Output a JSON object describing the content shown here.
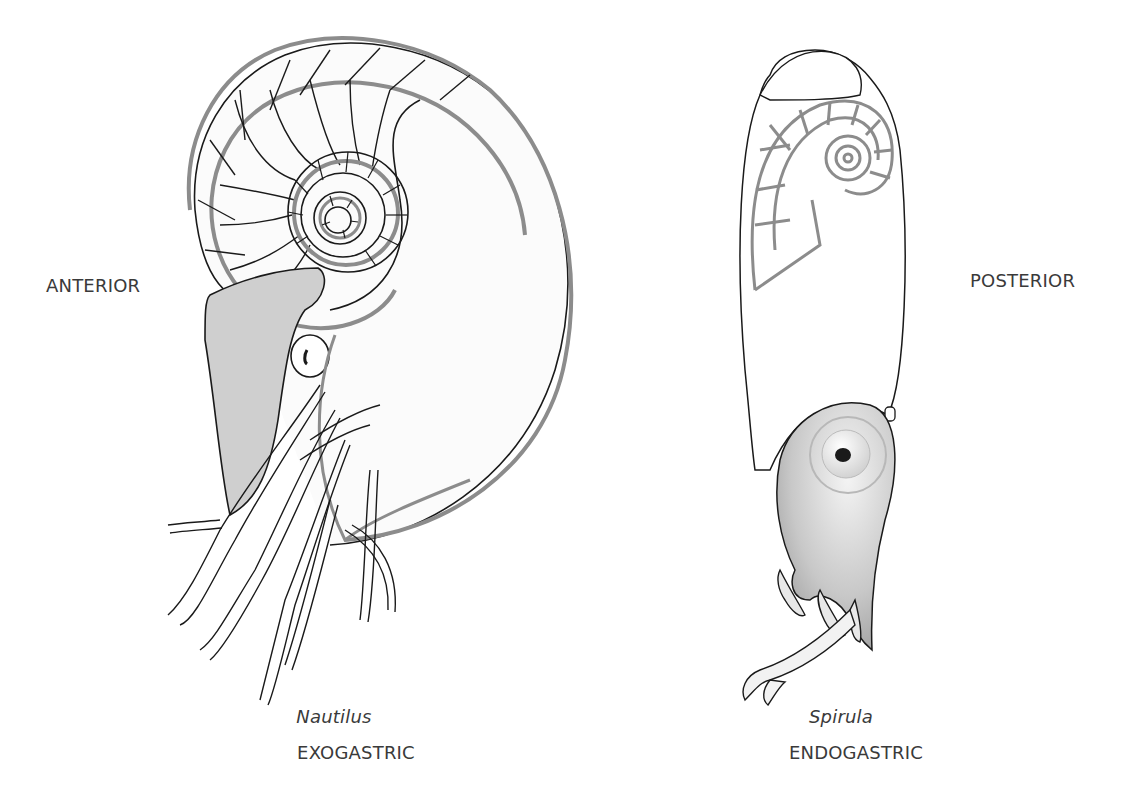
{
  "labels": {
    "left_orientation": "ANTERIOR",
    "right_orientation": "POSTERIOR"
  },
  "specimens": [
    {
      "name": "Nautilus",
      "coiling": "EXOGASTRIC"
    },
    {
      "name": "Spirula",
      "coiling": "ENDOGASTRIC"
    }
  ],
  "colors": {
    "outline": "#1a1a1a",
    "shell_gray": "#8c8c8c",
    "fill_gray": "#cfcfcf",
    "background": "#ffffff"
  }
}
